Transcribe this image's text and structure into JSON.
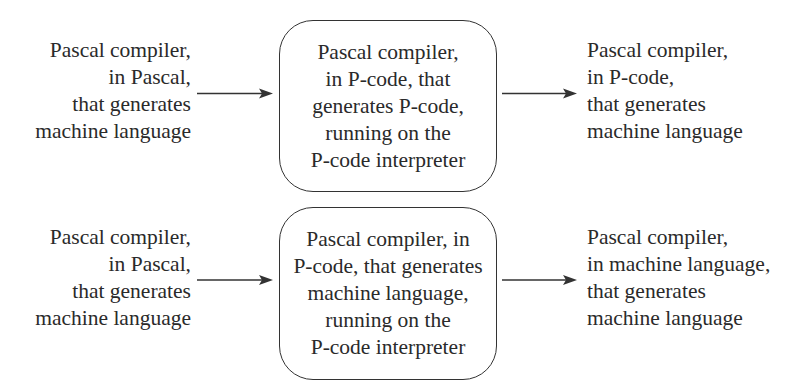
{
  "diagram": {
    "rows": [
      {
        "input": {
          "lines": [
            "Pascal compiler,",
            "in Pascal,",
            "that generates",
            "machine language"
          ]
        },
        "process": {
          "lines": [
            "Pascal compiler,",
            "in P-code, that",
            "generates P-code,",
            "running on the",
            "P-code interpreter"
          ]
        },
        "output": {
          "lines": [
            "Pascal compiler,",
            "in P-code,",
            "that generates",
            "machine language"
          ]
        }
      },
      {
        "input": {
          "lines": [
            "Pascal compiler,",
            "in Pascal,",
            "that generates",
            "machine language"
          ]
        },
        "process": {
          "lines": [
            "Pascal compiler, in",
            "P-code, that generates",
            "machine language,",
            "running on the",
            "P-code interpreter"
          ]
        },
        "output": {
          "lines": [
            "Pascal compiler,",
            "in machine language,",
            "that generates",
            "machine language"
          ]
        }
      }
    ],
    "arrows": [
      {
        "from": "row0-input",
        "to": "row0-process",
        "icon": "arrow-right-icon"
      },
      {
        "from": "row0-process",
        "to": "row0-output",
        "icon": "arrow-right-icon"
      },
      {
        "from": "row1-input",
        "to": "row1-process",
        "icon": "arrow-right-icon"
      },
      {
        "from": "row1-process",
        "to": "row1-output",
        "icon": "arrow-right-icon"
      }
    ],
    "colors": {
      "stroke": "#333333",
      "text": "#2a2a2a",
      "background": "#ffffff"
    }
  }
}
